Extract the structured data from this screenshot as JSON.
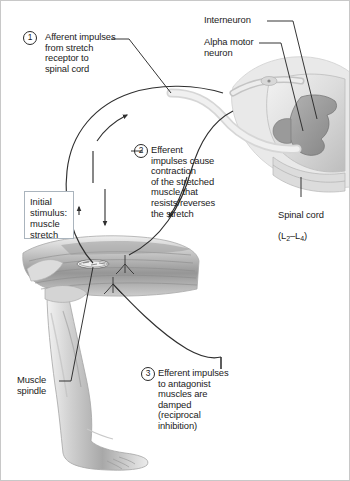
{
  "figure": {
    "background": "#ffffff",
    "border_color": "#c8c8c8"
  },
  "callouts": {
    "step1": {
      "number": "1",
      "text": "Afferent impulses\nfrom stretch\nreceptor to\nspinal cord"
    },
    "step2": {
      "number": "2",
      "text": "Efferent\nimpulses cause\ncontraction\nof the stretched\nmuscle that\nresists/reverses\nthe stretch"
    },
    "step3": {
      "number": "3",
      "text": "Efferent impulses\nto antagonist\nmuscles are\ndamped\n(reciprocal\ninhibition)"
    }
  },
  "labels": {
    "interneuron": "Interneuron",
    "alpha_motor_neuron": "Alpha motor\nneuron",
    "spinal_cord": "Spinal cord",
    "spinal_cord_segments_prefix": "(L",
    "spinal_cord_segment_1": "2",
    "spinal_cord_segment_dash": "–L",
    "spinal_cord_segment_2": "4",
    "spinal_cord_segments_suffix": ")",
    "muscle_spindle": "Muscle\nspindle",
    "initial_stimulus": "Initial\nstimulus:\nmuscle\nstretch"
  },
  "colors": {
    "ink": "#1b1b1b",
    "line": "#2a2a2a",
    "box_border": "#aab4bd",
    "tissue_light": "#e4e4e4",
    "tissue_mid": "#b8b8b8",
    "tissue_dark": "#8d8d8d",
    "nerve": "#4a4a4a"
  }
}
